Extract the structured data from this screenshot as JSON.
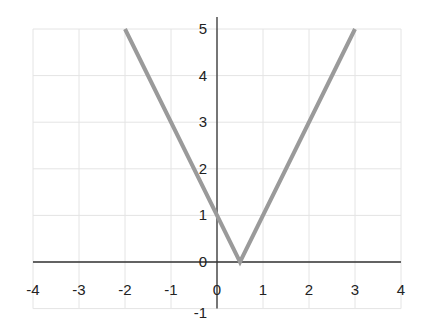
{
  "chart_data": {
    "type": "line",
    "title": "",
    "xlabel": "",
    "ylabel": "",
    "xlim": [
      -4,
      4
    ],
    "ylim": [
      -1,
      5
    ],
    "grid": true,
    "x_ticks": [
      -4,
      -3,
      -2,
      -1,
      0,
      1,
      2,
      3,
      4
    ],
    "y_ticks": [
      -1,
      0,
      1,
      2,
      3,
      4,
      5
    ],
    "series": [
      {
        "name": "y = |2x - 1|",
        "color": "#9a9a9a",
        "x": [
          -2,
          0.5,
          3
        ],
        "y": [
          5,
          0,
          5
        ]
      }
    ]
  },
  "colors": {
    "grid": "#e4e4e4",
    "axis": "#333333",
    "line": "#9a9a9a"
  }
}
